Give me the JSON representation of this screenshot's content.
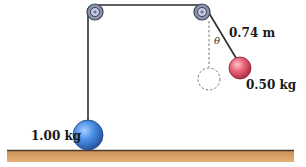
{
  "diagram": {
    "type": "pulley-pendulum-system",
    "labels": {
      "mass_left": "1.00 kg",
      "mass_right": "0.50 kg",
      "string_length": "0.74 m",
      "angle": "θ"
    },
    "colors": {
      "background": "#ffffff",
      "floor": "#d9a46a",
      "floor_edge": "#5a4a3a",
      "rope": "#2b2b2b",
      "pulley_outer": "#8a93b0",
      "pulley_inner": "#c5cbe0",
      "pulley_edge": "#3d4257",
      "ball_left": "#3f7fd6",
      "ball_right": "#e0576b",
      "dashed": "#777777"
    }
  }
}
